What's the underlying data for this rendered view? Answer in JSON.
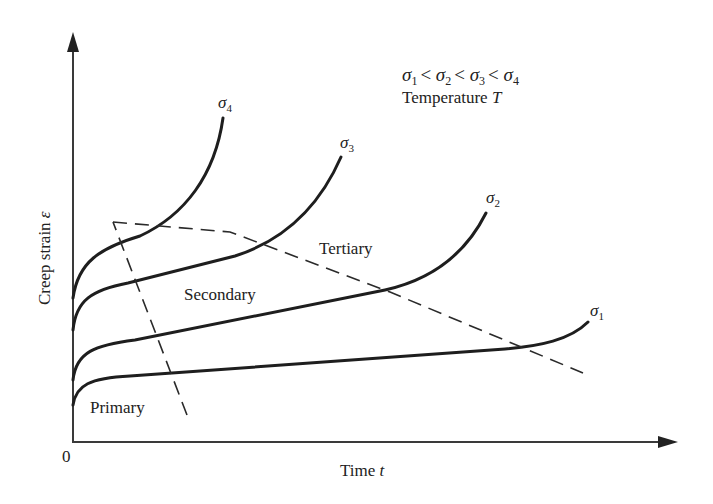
{
  "diagram": {
    "type": "creep-curves",
    "axes": {
      "y_label": "Creep strain",
      "y_symbol": "ε",
      "x_label": "Time",
      "x_symbol": "t",
      "origin_label": "0"
    },
    "legend": {
      "relation_parts": [
        "σ",
        "1",
        "<",
        "σ",
        "2",
        "<",
        "σ",
        "3",
        "<",
        "σ",
        "4"
      ],
      "temperature_label": "Temperature",
      "temperature_symbol": "T"
    },
    "curves": [
      {
        "name": "σ1",
        "base": "σ",
        "sub": "1"
      },
      {
        "name": "σ2",
        "base": "σ",
        "sub": "2"
      },
      {
        "name": "σ3",
        "base": "σ",
        "sub": "3"
      },
      {
        "name": "σ4",
        "base": "σ",
        "sub": "4"
      }
    ],
    "regions": {
      "primary": "Primary",
      "secondary": "Secondary",
      "tertiary": "Tertiary"
    },
    "colors": {
      "ink": "#1e1e1e",
      "background": "#ffffff"
    }
  }
}
